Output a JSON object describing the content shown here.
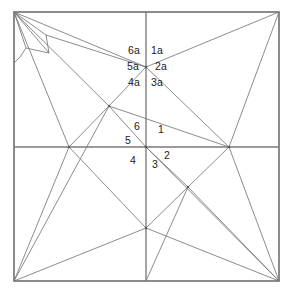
{
  "figure": {
    "background_color": "#ffffff",
    "line_color": "#777777",
    "frame_color": "#6e6e6e",
    "label_color": "#1a1a1a",
    "width": 294,
    "height": 301
  },
  "frame": {
    "left": 14,
    "top": 12,
    "right": 279,
    "bottom": 281
  },
  "axes": {
    "vertical_x": 146,
    "horizontal_y": 147
  },
  "vertices": [
    {
      "name": "top-left-corner",
      "x": 14,
      "y": 12
    },
    {
      "name": "top-right-corner",
      "x": 279,
      "y": 12
    },
    {
      "name": "bottom-left-corner",
      "x": 14,
      "y": 281
    },
    {
      "name": "bottom-right-corner",
      "x": 279,
      "y": 281
    },
    {
      "name": "top-mid",
      "x": 146,
      "y": 12
    },
    {
      "name": "bottom-mid",
      "x": 146,
      "y": 281
    },
    {
      "name": "left-mid",
      "x": 14,
      "y": 147
    },
    {
      "name": "right-mid",
      "x": 279,
      "y": 147
    },
    {
      "name": "center",
      "x": 146,
      "y": 147
    },
    {
      "name": "upper-hub",
      "x": 146,
      "y": 67
    },
    {
      "name": "upper-left-hub",
      "x": 109,
      "y": 106
    },
    {
      "name": "left-edge-hub",
      "x": 69,
      "y": 147
    },
    {
      "name": "right-edge-hub",
      "x": 229,
      "y": 147
    },
    {
      "name": "lower-mid-hub",
      "x": 146,
      "y": 228
    },
    {
      "name": "lower-right-hub",
      "x": 188,
      "y": 187
    },
    {
      "name": "corner-poly-a",
      "x": 46,
      "y": 35
    },
    {
      "name": "corner-poly-b",
      "x": 49,
      "y": 53
    },
    {
      "name": "corner-poly-c",
      "x": 26,
      "y": 48
    },
    {
      "name": "corner-poly-d",
      "x": 20,
      "y": 57
    }
  ],
  "labels": {
    "upper_cluster": [
      {
        "id": "label-6a",
        "text": "6a",
        "x": 128,
        "y": 45
      },
      {
        "id": "label-1a",
        "text": "1a",
        "x": 151,
        "y": 45
      },
      {
        "id": "label-5a",
        "text": "5a",
        "x": 127,
        "y": 61
      },
      {
        "id": "label-2a",
        "text": "2a",
        "x": 155,
        "y": 61
      },
      {
        "id": "label-4a",
        "text": "4a",
        "x": 128,
        "y": 77
      },
      {
        "id": "label-3a",
        "text": "3a",
        "x": 151,
        "y": 77
      }
    ],
    "center_cluster": [
      {
        "id": "label-6",
        "text": "6",
        "x": 134,
        "y": 122
      },
      {
        "id": "label-1",
        "text": "1",
        "x": 158,
        "y": 124
      },
      {
        "id": "label-5",
        "text": "5",
        "x": 125,
        "y": 136
      },
      {
        "id": "label-2",
        "text": "2",
        "x": 164,
        "y": 150
      },
      {
        "id": "label-4",
        "text": "4",
        "x": 130,
        "y": 155
      },
      {
        "id": "label-3",
        "text": "3",
        "x": 152,
        "y": 159
      }
    ]
  },
  "segments": {
    "frame": [
      "14,12 279,12",
      "279,12 279,281",
      "279,281 14,281",
      "14,281 14,12"
    ],
    "axes": [
      "146,12 146,281",
      "14,147 279,147"
    ],
    "network": [
      "14,12 146,67",
      "14,12 109,106",
      "14,12 69,147",
      "14,12 46,35",
      "14,12 26,48",
      "14,12 49,53",
      "46,35 49,53",
      "49,53 26,48",
      "26,48 20,57",
      "20,57 14,62",
      "46,35 146,67",
      "146,67 279,12",
      "146,67 109,106",
      "146,67 229,147",
      "109,106 69,147",
      "109,106 146,147",
      "109,106 14,281",
      "109,106 229,147",
      "69,147 146,228",
      "69,147 14,281",
      "146,147 188,187",
      "146,147 279,281",
      "229,147 279,12",
      "229,147 188,187",
      "229,147 279,281",
      "188,187 146,228",
      "188,187 279,281",
      "188,187 146,281",
      "146,228 14,281",
      "146,228 279,281",
      "146,228 146,281"
    ]
  }
}
